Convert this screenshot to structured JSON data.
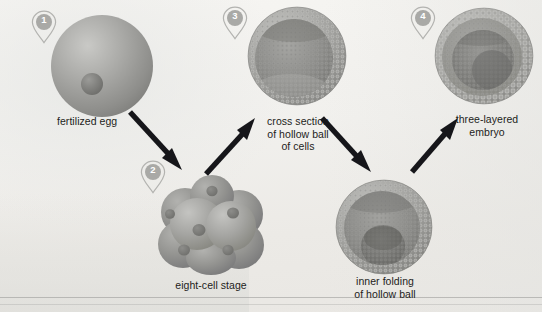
{
  "diagram": {
    "background_color": "#f2f1ee",
    "ink_color": "#1d1d1b",
    "cell_color": "#9c9c99",
    "marker_color": "#a9a9a6"
  },
  "markers": [
    {
      "number": "1",
      "stage": "fertilized-egg"
    },
    {
      "number": "2",
      "stage": "eight-cell-stage"
    },
    {
      "number": "3",
      "stage": "cross-section-hollow-ball"
    },
    {
      "number": "4",
      "stage": "three-layered-embryo"
    }
  ],
  "labels": {
    "stage1": "fertilized egg",
    "stage2": "eight-cell stage",
    "stage3": "cross section\nof hollow ball\nof cells",
    "stage4": "three-layered\nembryo",
    "stage_gastrula": "inner folding\nof hollow ball"
  }
}
